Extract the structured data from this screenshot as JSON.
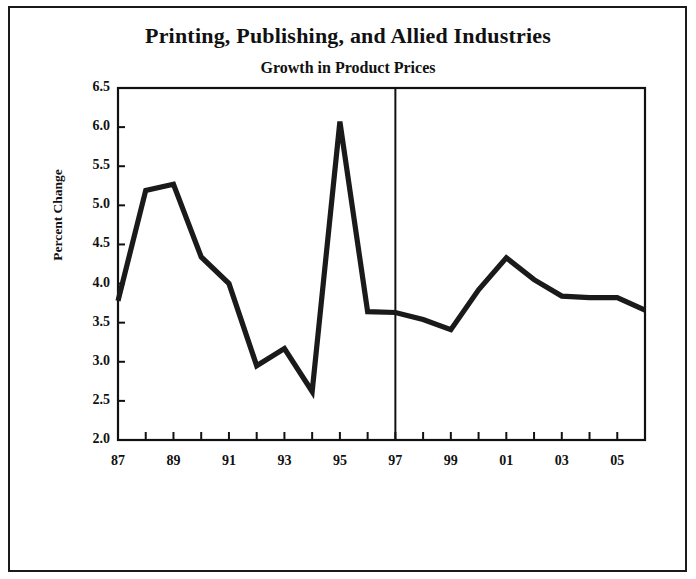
{
  "figure": {
    "title": "Printing, Publishing, and Allied Industries",
    "subtitle": "Growth in Product Prices",
    "ylabel": "Percent Change",
    "line_color": "#1a1a1a",
    "axis_color": "#111111",
    "background": "#ffffff"
  },
  "chart_data": {
    "type": "line",
    "title": "Printing, Publishing, and Allied Industries",
    "subtitle": "Growth in Product Prices",
    "xlabel": "",
    "ylabel": "Percent Change",
    "ylim": [
      2.0,
      6.5
    ],
    "ytick_labels": [
      "6.5",
      "6.0",
      "5.5",
      "5.0",
      "4.5",
      "4.0",
      "3.5",
      "3.0",
      "2.5",
      "2.0"
    ],
    "ytick_values": [
      6.5,
      6.0,
      5.5,
      5.0,
      4.5,
      4.0,
      3.5,
      3.0,
      2.5,
      2.0
    ],
    "xlim": [
      1987,
      2006
    ],
    "x": [
      1987,
      1988,
      1989,
      1990,
      1991,
      1992,
      1993,
      1994,
      1995,
      1996,
      1997,
      1998,
      1999,
      2000,
      2001,
      2002,
      2003,
      2004,
      2005,
      2006
    ],
    "xtick_labels_shown": [
      "87",
      "89",
      "91",
      "93",
      "95",
      "97",
      "99",
      "01",
      "03",
      "05"
    ],
    "xtick_label_values": [
      1987,
      1989,
      1991,
      1993,
      1995,
      1997,
      1999,
      2001,
      2003,
      2005
    ],
    "values": [
      3.78,
      5.19,
      5.27,
      4.34,
      4.0,
      2.95,
      3.17,
      2.62,
      6.07,
      3.64,
      3.63,
      3.54,
      3.41,
      3.92,
      4.33,
      4.05,
      3.84,
      3.82,
      3.82,
      3.66
    ],
    "grid": false,
    "legend": null,
    "annotations": [
      {
        "type": "vertical-line",
        "at_x": 1997,
        "label": "forecast-divider"
      }
    ]
  }
}
